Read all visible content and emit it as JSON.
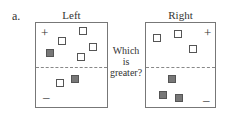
{
  "label": "a.",
  "question": {
    "line1": "Which",
    "line2": "is",
    "line3": "greater?"
  },
  "colors": {
    "positive_fill": "#ffffff",
    "negative_fill": "#777777",
    "border": "#555555"
  },
  "panels": [
    {
      "title": "Left",
      "plus_sign": "+",
      "minus_sign": "–",
      "positive_count": 5,
      "negative_count": 1,
      "top_region": {
        "hollow_squares": 4,
        "filled_squares": 1
      },
      "bottom_region": {
        "hollow_squares": 1,
        "filled_squares": 1
      }
    },
    {
      "title": "Right",
      "plus_sign": "+",
      "minus_sign": "–",
      "top_region": {
        "hollow_squares": 3,
        "filled_squares": 0
      },
      "bottom_region": {
        "hollow_squares": 0,
        "filled_squares": 3
      }
    }
  ]
}
